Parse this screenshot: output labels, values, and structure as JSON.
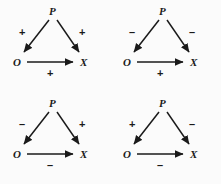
{
  "figure": {
    "background_color": "#fbfbfb",
    "ink_color": "#1a1a1a",
    "panel_count": 4,
    "nodes": {
      "source": "P",
      "left": "O",
      "right": "X"
    },
    "edges": [
      "P->O",
      "P->X",
      "O->X"
    ]
  },
  "panels": [
    {
      "id": "panel-1",
      "position": "top-left",
      "node_p": "P",
      "node_o": "O",
      "node_x": "X",
      "sign_po": "+",
      "sign_px": "+",
      "sign_ox": "+"
    },
    {
      "id": "panel-2",
      "position": "top-right",
      "node_p": "P",
      "node_o": "O",
      "node_x": "X",
      "sign_po": "–",
      "sign_px": "–",
      "sign_ox": "+"
    },
    {
      "id": "panel-3",
      "position": "bottom-left",
      "node_p": "P",
      "node_o": "O",
      "node_x": "X",
      "sign_po": "–",
      "sign_px": "+",
      "sign_ox": "–"
    },
    {
      "id": "panel-4",
      "position": "bottom-right",
      "node_p": "P",
      "node_o": "O",
      "node_x": "X",
      "sign_po": "+",
      "sign_px": "–",
      "sign_ox": "–"
    }
  ]
}
